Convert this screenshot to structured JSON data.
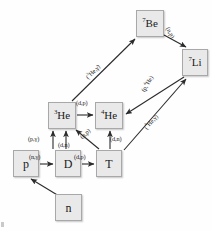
{
  "diagram": {
    "style": {
      "node_fill": "#e9e9e9",
      "node_border": "#a8a8a8",
      "arrow_color": "#2b2b2b",
      "text_color": "#1a1a1a",
      "background": "#fefefe"
    },
    "nodes": [
      {
        "id": "n",
        "label": "n",
        "sup": "",
        "base": "n",
        "x": 55,
        "y": 194,
        "w": 27,
        "h": 27,
        "font": 12
      },
      {
        "id": "p",
        "label": "p",
        "sup": "",
        "base": "p",
        "x": 13,
        "y": 150,
        "w": 26,
        "h": 27,
        "font": 12
      },
      {
        "id": "D",
        "label": "D",
        "sup": "",
        "base": "D",
        "x": 55,
        "y": 150,
        "w": 26,
        "h": 27,
        "font": 12
      },
      {
        "id": "T",
        "label": "T",
        "sup": "",
        "base": "T",
        "x": 96,
        "y": 150,
        "w": 26,
        "h": 27,
        "font": 12
      },
      {
        "id": "He3",
        "label": "3He",
        "sup": "3",
        "base": "He",
        "x": 48,
        "y": 102,
        "w": 28,
        "h": 27,
        "font": 11
      },
      {
        "id": "He4",
        "label": "4He",
        "sup": "4",
        "base": "He",
        "x": 95,
        "y": 102,
        "w": 28,
        "h": 27,
        "font": 11
      },
      {
        "id": "Be7",
        "label": "7Be",
        "sup": "7",
        "base": "Be",
        "x": 136,
        "y": 10,
        "w": 28,
        "h": 27,
        "font": 11
      },
      {
        "id": "Li7",
        "label": "7Li",
        "sup": "7",
        "base": "Li",
        "x": 182,
        "y": 49,
        "w": 26,
        "h": 27,
        "font": 11
      }
    ],
    "edges": [
      {
        "id": "n-p",
        "from": "n",
        "to": "p",
        "label": "",
        "sup": "",
        "rest": ""
      },
      {
        "id": "p-D",
        "from": "p",
        "to": "D",
        "label": "(n,γ)",
        "sup": "",
        "rest": "(n,γ)"
      },
      {
        "id": "D-T",
        "from": "D",
        "to": "T",
        "label": "(d,p)",
        "sup": "",
        "rest": "(d,p)"
      },
      {
        "id": "p-He3",
        "from": "p",
        "to": "He3",
        "label": "(p,γ)",
        "sup": "",
        "rest": "(p,γ)"
      },
      {
        "id": "D-He3",
        "from": "D",
        "to": "He3",
        "label": "(d,n)",
        "sup": "",
        "rest": "(d,n)"
      },
      {
        "id": "T-He4",
        "from": "T",
        "to": "He4",
        "label": "(d,n)",
        "sup": "",
        "rest": "(d,n)"
      },
      {
        "id": "T-He3",
        "from": "T",
        "to": "He3",
        "label": "(n,p)",
        "sup": "",
        "rest": "(n,p)"
      },
      {
        "id": "He3-He4",
        "from": "He3",
        "to": "He4",
        "label": "(d,p)",
        "sup": "",
        "rest": "(d,p)"
      },
      {
        "id": "He3-Be7",
        "from": "He3",
        "to": "Be7",
        "label": "(3He,γ)",
        "sup": "3",
        "rest": "He,γ)"
      },
      {
        "id": "Be7-Li7",
        "from": "Be7",
        "to": "Li7",
        "label": "(n,p)",
        "sup": "",
        "rest": "(n,p)"
      },
      {
        "id": "Li7-He4",
        "from": "Li7",
        "to": "He4",
        "label": "(p,4He)",
        "sup": "4",
        "rest": "He)"
      },
      {
        "id": "T-Li7",
        "from": "T",
        "to": "Li7",
        "label": "(4He,γ)",
        "sup": "4",
        "rest": "He,γ)"
      }
    ],
    "labels": {
      "n_p": "(n,γ)",
      "d_p": "(d,p)",
      "p_gamma": "(p,γ)",
      "d_n_1": "(d,n)",
      "d_n_2": "(d,n)",
      "n_p_diag": "(n,p)",
      "d_p_top": "(d,p)",
      "n_p_be": "(n,p)",
      "he3_g_open": "(",
      "he3_g_sup": "3",
      "he3_g_rest": "He,γ)",
      "p4he_open": "(p,",
      "p4he_sup": "4",
      "p4he_rest": "He)",
      "he4_g_open": "(",
      "he4_g_sup": "4",
      "he4_g_rest": "He,γ)"
    }
  }
}
